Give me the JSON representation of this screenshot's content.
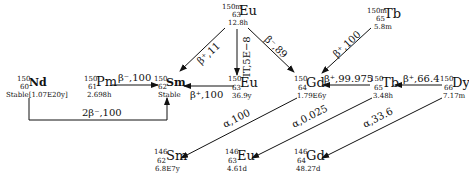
{
  "nuclides": [
    {
      "id": "nd150",
      "mass": "150",
      "z": "60",
      "symbol": "Nd",
      "halflife": "Stable[1.07E20y]",
      "bold": true
    },
    {
      "id": "pm150",
      "mass": "150",
      "z": "61",
      "symbol": "Pm",
      "halflife": "2.698h"
    },
    {
      "id": "sm150",
      "mass": "150",
      "z": "62",
      "symbol": "Sm",
      "halflife": "Stable",
      "bold": true
    },
    {
      "id": "eu150m",
      "mass": "150m",
      "z": "63",
      "symbol": "Eu",
      "halflife": "12.8h"
    },
    {
      "id": "eu150",
      "mass": "150",
      "z": "63",
      "symbol": "Eu",
      "halflife": "36.9y"
    },
    {
      "id": "gd150",
      "mass": "150",
      "z": "64",
      "symbol": "Gd",
      "halflife": "1.79E6y"
    },
    {
      "id": "tb150m",
      "mass": "150m",
      "z": "65",
      "symbol": "Tb",
      "halflife": "5.8m"
    },
    {
      "id": "tb150",
      "mass": "150",
      "z": "65",
      "symbol": "Tb",
      "halflife": "3.48h"
    },
    {
      "id": "dy150",
      "mass": "150",
      "z": "66",
      "symbol": "Dy",
      "halflife": "7.17m"
    },
    {
      "id": "sm146",
      "mass": "146",
      "z": "62",
      "symbol": "Sm",
      "halflife": "6.8E7y"
    },
    {
      "id": "eu146",
      "mass": "146",
      "z": "63",
      "symbol": "Eu",
      "halflife": "4.61d"
    },
    {
      "id": "gd146",
      "mass": "146",
      "z": "64",
      "symbol": "Gd",
      "halflife": "48.27d"
    }
  ],
  "decays": [
    {
      "from": "Pm150",
      "to": "Sm150",
      "label": "β⁻,100"
    },
    {
      "from": "Nd150",
      "to": "Sm150",
      "label": "2β⁻,100"
    },
    {
      "from": "Eu150m",
      "to": "Sm150",
      "label": "β⁺,11"
    },
    {
      "from": "Eu150m",
      "to": "Eu150",
      "label": "IT,5E−8"
    },
    {
      "from": "Eu150m",
      "to": "Gd150",
      "label": "β⁻,89"
    },
    {
      "from": "Eu150",
      "to": "Sm150",
      "label": "β⁺,100"
    },
    {
      "from": "Tb150m",
      "to": "Gd150",
      "label": "β⁺,100"
    },
    {
      "from": "Tb150",
      "to": "Gd150",
      "label": "β⁺,99.975"
    },
    {
      "from": "Dy150",
      "to": "Tb150",
      "label": "β⁺,66.4"
    },
    {
      "from": "Gd150",
      "to": "Sm146",
      "label": "α,100"
    },
    {
      "from": "Tb150",
      "to": "Eu146",
      "label": "α,0.025"
    },
    {
      "from": "Dy150",
      "to": "Gd146",
      "label": "α,33.6"
    }
  ]
}
